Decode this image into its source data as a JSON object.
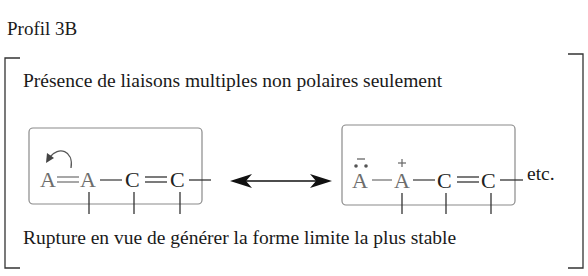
{
  "title": "Profil 3B",
  "heading": "Présence de liaisons multiples non polaires seulement",
  "footer": "Rupture en vue de générer la forme limite la plus stable",
  "left_structure": {
    "atoms": [
      "A",
      "A",
      "C",
      "C"
    ],
    "bonds": [
      "double",
      "single",
      "double",
      "single"
    ],
    "arrow": "curved-arrow"
  },
  "right_structure": {
    "atoms": [
      "A",
      "A",
      "C",
      "C"
    ],
    "charges": {
      "atom1": "−",
      "atom2": "+"
    },
    "lone_pair": "••",
    "bonds": [
      "single",
      "single",
      "double",
      "single"
    ]
  },
  "resonance_arrow": "double-headed-arrow",
  "etc": "etc.",
  "labels": {
    "a": "A",
    "c": "C",
    "minus": "−",
    "plus": "+"
  },
  "colors": {
    "text": "#1a1a1a",
    "atom_a": "#6d6d6d",
    "box_border": "#8a8a8a"
  }
}
